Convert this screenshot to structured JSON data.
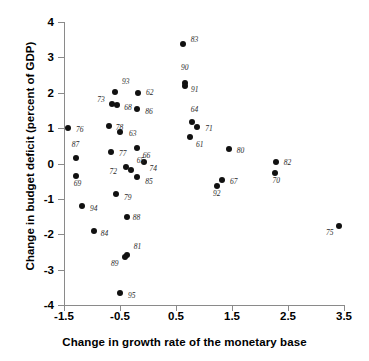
{
  "chart_data": {
    "type": "scatter",
    "title": "",
    "xlabel": "Change in growth rate of the monetary base",
    "ylabel": "Change in budget deficit (percent of GDP)",
    "xlim": [
      -1.5,
      3.5
    ],
    "ylim": [
      -4,
      4
    ],
    "xticks": [
      "-1.5",
      "-0.5",
      "0.5",
      "1.5",
      "2.5",
      "3.5"
    ],
    "xtick_values": [
      -1.5,
      -0.5,
      0.5,
      1.5,
      2.5,
      3.5
    ],
    "yticks": [
      "4",
      "3",
      "2",
      "1",
      "0",
      "-1",
      "-2",
      "-3",
      "-4"
    ],
    "ytick_values": [
      4,
      3,
      2,
      1,
      0,
      -1,
      -2,
      -3,
      -4
    ],
    "grid": false,
    "legend": null,
    "point_label_field": "year",
    "points": [
      {
        "year": "83",
        "x": 0.62,
        "y": 3.37,
        "lx": 8,
        "ly": -4
      },
      {
        "year": "90",
        "x": 0.66,
        "y": 2.28,
        "lx": -4,
        "ly": -15
      },
      {
        "year": "91",
        "x": 0.66,
        "y": 2.2,
        "lx": 6,
        "ly": 4
      },
      {
        "year": "93",
        "x": -0.59,
        "y": 2.03,
        "lx": 7,
        "ly": -10
      },
      {
        "year": "62",
        "x": -0.18,
        "y": 1.98,
        "lx": 8,
        "ly": 0
      },
      {
        "year": "73",
        "x": -0.64,
        "y": 1.69,
        "lx": -15,
        "ly": -4
      },
      {
        "year": "68",
        "x": -0.55,
        "y": 1.66,
        "lx": 7,
        "ly": 3
      },
      {
        "year": "86",
        "x": -0.19,
        "y": 1.53,
        "lx": 8,
        "ly": 3
      },
      {
        "year": "64",
        "x": 0.78,
        "y": 1.18,
        "lx": -1,
        "ly": -12
      },
      {
        "year": "71",
        "x": 0.88,
        "y": 1.04,
        "lx": 8,
        "ly": 2
      },
      {
        "year": "76",
        "x": -1.43,
        "y": 1.01,
        "lx": 8,
        "ly": 2
      },
      {
        "year": "78",
        "x": -0.7,
        "y": 1.06,
        "lx": 7,
        "ly": 2
      },
      {
        "year": "63",
        "x": -0.5,
        "y": 0.89,
        "lx": 9,
        "ly": 2
      },
      {
        "year": "61",
        "x": 0.75,
        "y": 0.75,
        "lx": 0,
        "ly": 8
      },
      {
        "year": "77",
        "x": -0.66,
        "y": 0.33,
        "lx": 8,
        "ly": 2
      },
      {
        "year": "66",
        "x": -0.2,
        "y": 0.43,
        "lx": 6,
        "ly": 8
      },
      {
        "year": "80",
        "x": 1.44,
        "y": 0.41,
        "lx": 8,
        "ly": 2
      },
      {
        "year": "87",
        "x": -1.29,
        "y": 0.15,
        "lx": -4,
        "ly": -13
      },
      {
        "year": "82",
        "x": 2.28,
        "y": 0.04,
        "lx": 8,
        "ly": 1
      },
      {
        "year": "74",
        "x": -0.08,
        "y": 0.03,
        "lx": 6,
        "ly": 7
      },
      {
        "year": "72",
        "x": -0.4,
        "y": -0.1,
        "lx": -16,
        "ly": 5
      },
      {
        "year": "65",
        "x": -0.31,
        "y": -0.18,
        "lx": 6,
        "ly": -9
      },
      {
        "year": "70",
        "x": 2.26,
        "y": -0.27,
        "lx": -2,
        "ly": 8
      },
      {
        "year": "69",
        "x": -1.29,
        "y": -0.35,
        "lx": -2,
        "ly": 8
      },
      {
        "year": "85",
        "x": -0.19,
        "y": -0.37,
        "lx": 8,
        "ly": 5
      },
      {
        "year": "67",
        "x": 1.32,
        "y": -0.48,
        "lx": 8,
        "ly": 2
      },
      {
        "year": "92",
        "x": 1.23,
        "y": -0.63,
        "lx": -4,
        "ly": 8
      },
      {
        "year": "79",
        "x": -0.57,
        "y": -0.85,
        "lx": 8,
        "ly": 4
      },
      {
        "year": "94",
        "x": -1.18,
        "y": -1.19,
        "lx": 8,
        "ly": 3
      },
      {
        "year": "88",
        "x": -0.38,
        "y": -1.5,
        "lx": 6,
        "ly": 1
      },
      {
        "year": "75",
        "x": 3.41,
        "y": -1.76,
        "lx": -13,
        "ly": 7
      },
      {
        "year": "84",
        "x": -0.97,
        "y": -1.92,
        "lx": 7,
        "ly": 3
      },
      {
        "year": "81",
        "x": -0.38,
        "y": -2.6,
        "lx": 7,
        "ly": -8
      },
      {
        "year": "89",
        "x": -0.41,
        "y": -2.63,
        "lx": -14,
        "ly": 7
      },
      {
        "year": "95",
        "x": -0.5,
        "y": -3.65,
        "lx": 8,
        "ly": 3
      }
    ]
  }
}
